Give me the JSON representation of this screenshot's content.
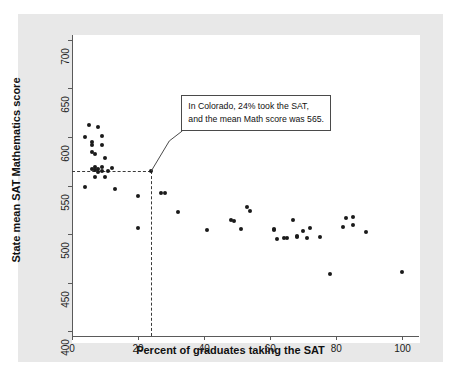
{
  "figure": {
    "background_color": "#e8e8e8",
    "plot_background_color": "#ffffff",
    "axis_color": "#5a5a5a",
    "point_color": "#1a1a1a"
  },
  "annotation": {
    "line1": "In Colorado, 24% took the SAT,",
    "line2": "and the mean Math score was 565.",
    "target_x": 24,
    "target_y": 565
  },
  "chart_data": {
    "type": "scatter",
    "title": "",
    "xlabel": "Percent of graduates taking the SAT",
    "ylabel": "State mean SAT Mathematics score",
    "xlim": [
      0,
      105
    ],
    "ylim": [
      395,
      705
    ],
    "xticks": [
      0,
      20,
      40,
      60,
      80,
      100
    ],
    "yticks": [
      400,
      450,
      500,
      550,
      600,
      650,
      700
    ],
    "xtick_labels": [
      "0",
      "20",
      "40",
      "60",
      "80",
      "100"
    ],
    "ytick_labels": [
      "400",
      "450",
      "500",
      "550",
      "600",
      "650",
      "700"
    ],
    "grid": false,
    "legend": false,
    "marker": "filled-circle",
    "points": [
      [
        4,
        548
      ],
      [
        4,
        600
      ],
      [
        5,
        612
      ],
      [
        6,
        584
      ],
      [
        6,
        592
      ],
      [
        6,
        595
      ],
      [
        6,
        567
      ],
      [
        7,
        559
      ],
      [
        7,
        566
      ],
      [
        7,
        569
      ],
      [
        7,
        582
      ],
      [
        8,
        610
      ],
      [
        8,
        564
      ],
      [
        8,
        567
      ],
      [
        9,
        601
      ],
      [
        9,
        592
      ],
      [
        9,
        569
      ],
      [
        9,
        565
      ],
      [
        10,
        578
      ],
      [
        10,
        559
      ],
      [
        11,
        565
      ],
      [
        12,
        568
      ],
      [
        13,
        546
      ],
      [
        20,
        539
      ],
      [
        20,
        506
      ],
      [
        24,
        565
      ],
      [
        27,
        542
      ],
      [
        28,
        542
      ],
      [
        32,
        523
      ],
      [
        41,
        504
      ],
      [
        48,
        514
      ],
      [
        49,
        513
      ],
      [
        51,
        505
      ],
      [
        53,
        528
      ],
      [
        54,
        524
      ],
      [
        61,
        504
      ],
      [
        61,
        505
      ],
      [
        62,
        495
      ],
      [
        64,
        496
      ],
      [
        65,
        496
      ],
      [
        67,
        514
      ],
      [
        68,
        497
      ],
      [
        68,
        498
      ],
      [
        70,
        503
      ],
      [
        71,
        496
      ],
      [
        72,
        506
      ],
      [
        75,
        497
      ],
      [
        78,
        459
      ],
      [
        82,
        507
      ],
      [
        83,
        517
      ],
      [
        85,
        518
      ],
      [
        85,
        509
      ],
      [
        89,
        502
      ],
      [
        100,
        461
      ]
    ]
  }
}
